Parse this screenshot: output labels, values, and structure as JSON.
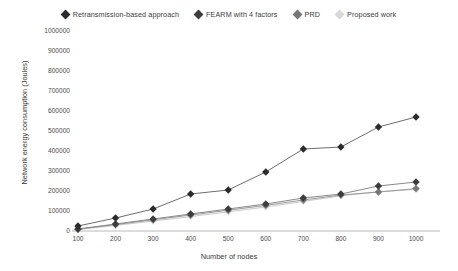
{
  "chart_data": {
    "type": "line",
    "title": "",
    "xlabel": "Number of nodes",
    "ylabel": "Network energy consumption (Joules)",
    "x": [
      100,
      200,
      300,
      400,
      500,
      600,
      700,
      800,
      900,
      1000
    ],
    "xtick_labels": [
      "100",
      "200",
      "300",
      "400",
      "500",
      "600",
      "700",
      "800",
      "900",
      "1000"
    ],
    "ytick_labels": [
      "0",
      "100000",
      "200000",
      "300000",
      "400000",
      "500000",
      "600000",
      "700000",
      "800000",
      "900000",
      "1000000"
    ],
    "ylim": [
      0,
      1000000
    ],
    "xlim": [
      100,
      1000
    ],
    "ytick_step": 100000,
    "grid": false,
    "legend_position": "top-center",
    "marker": "diamond",
    "series": [
      {
        "name": "Retransmission-based approach",
        "color": "#2b2b2b",
        "line_color": "#6d6d6d",
        "values": [
          25000,
          65000,
          110000,
          185000,
          205000,
          295000,
          410000,
          420000,
          520000,
          570000
        ]
      },
      {
        "name": "FEARM with 4 factors",
        "color": "#3d3d3d",
        "line_color": "#8a8a8a",
        "values": [
          10000,
          35000,
          60000,
          85000,
          110000,
          135000,
          165000,
          185000,
          225000,
          245000
        ]
      },
      {
        "name": "PRD",
        "color": "#777777",
        "line_color": "#9a9a9a",
        "values": [
          9000,
          32000,
          56000,
          80000,
          104000,
          128000,
          155000,
          180000,
          195000,
          212000
        ]
      },
      {
        "name": "Proposed work",
        "color": "#d8d8d8",
        "line_color": "#c9c9c9",
        "values": [
          7000,
          28000,
          50000,
          72000,
          96000,
          120000,
          148000,
          176000,
          196000,
          208000
        ]
      }
    ]
  },
  "legend": {
    "items": [
      {
        "label": "Retransmission-based approach",
        "color": "#2b2b2b"
      },
      {
        "label": "FEARM with 4 factors",
        "color": "#3d3d3d"
      },
      {
        "label": "PRD",
        "color": "#777777"
      },
      {
        "label": "Proposed work",
        "color": "#d8d8d8"
      }
    ]
  }
}
